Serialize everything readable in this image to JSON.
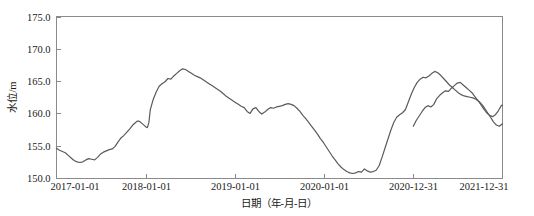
{
  "chart_data": {
    "type": "line",
    "title": "",
    "xlabel": "日期（年-月-日）",
    "ylabel": "水位/m",
    "grid": false,
    "legend": null,
    "line_color": "#5a5a5a",
    "axis_color": "#8a8a8a",
    "ylim": [
      150.0,
      175.0
    ],
    "yticks": [
      "150.0",
      "155.0",
      "160.0",
      "165.0",
      "170.0",
      "175.0"
    ],
    "ytick_values": [
      150.0,
      155.0,
      160.0,
      165.0,
      170.0,
      175.0
    ],
    "xticks": [
      "2017-01-01",
      "2018-01-01",
      "2019-01-01",
      "2020-01-01",
      "2020-12-31",
      "2021-12-31"
    ],
    "xtick_positions": [
      0,
      365,
      730,
      1095,
      1460,
      1825
    ],
    "xlim": [
      0,
      1825
    ],
    "series": [
      {
        "name": "水位",
        "x": [
          0,
          12,
          24,
          36,
          48,
          60,
          72,
          84,
          96,
          108,
          120,
          132,
          144,
          156,
          168,
          180,
          192,
          204,
          216,
          228,
          240,
          252,
          264,
          276,
          288,
          300,
          312,
          324,
          330,
          336,
          342,
          348,
          354,
          360,
          366,
          372,
          378,
          384,
          396,
          408,
          420,
          432,
          444,
          456,
          468,
          480,
          492,
          504,
          516,
          528,
          540,
          552,
          564,
          576,
          588,
          600,
          612,
          624,
          636,
          648,
          660,
          672,
          684,
          696,
          708,
          720,
          732,
          744,
          756,
          768,
          780,
          792,
          804,
          816,
          828,
          840,
          852,
          864,
          876,
          888,
          900,
          912,
          924,
          936,
          948,
          960,
          972,
          984,
          996,
          1008,
          1020,
          1032,
          1044,
          1056,
          1068,
          1080,
          1092,
          1104,
          1116,
          1128,
          1140,
          1152,
          1164,
          1176,
          1188,
          1200,
          1212,
          1224,
          1236,
          1248,
          1260,
          1272,
          1284,
          1296,
          1308,
          1320,
          1332,
          1344,
          1356,
          1368,
          1380,
          1392,
          1404,
          1416,
          1428,
          1440,
          1452,
          1464,
          1476,
          1488,
          1500,
          1512,
          1524,
          1536,
          1548,
          1560,
          1572,
          1584,
          1596,
          1608,
          1620,
          1632,
          1644,
          1656,
          1668,
          1680,
          1692,
          1704,
          1716,
          1728,
          1740,
          1752,
          1764,
          1776,
          1788,
          1800,
          1812,
          1825
        ],
        "values": [
          154.6,
          154.3,
          154.1,
          153.9,
          153.5,
          153.1,
          152.7,
          152.5,
          152.4,
          152.5,
          152.8,
          153.0,
          152.9,
          152.8,
          153.2,
          153.7,
          154.0,
          154.2,
          154.4,
          154.5,
          154.9,
          155.6,
          156.2,
          156.6,
          157.1,
          157.6,
          158.2,
          158.6,
          158.8,
          158.8,
          158.7,
          158.5,
          158.3,
          158.1,
          157.9,
          157.8,
          158.6,
          160.6,
          162.2,
          163.3,
          164.2,
          164.6,
          164.9,
          165.4,
          165.3,
          165.8,
          166.2,
          166.6,
          166.9,
          166.8,
          166.5,
          166.2,
          165.9,
          165.7,
          165.5,
          165.2,
          164.9,
          164.6,
          164.3,
          164.0,
          163.7,
          163.4,
          163.0,
          162.6,
          162.3,
          162.0,
          161.7,
          161.4,
          161.1,
          160.9,
          160.3,
          160.0,
          160.7,
          160.9,
          160.3,
          159.9,
          160.2,
          160.6,
          160.9,
          160.8,
          161.0,
          161.1,
          161.2,
          161.4,
          161.5,
          161.4,
          161.2,
          160.8,
          160.3,
          159.7,
          159.2,
          158.6,
          158.0,
          157.4,
          156.8,
          156.1,
          155.5,
          154.8,
          154.1,
          153.4,
          152.8,
          152.2,
          151.7,
          151.3,
          151.0,
          150.8,
          150.7,
          150.8,
          151.0,
          150.9,
          151.4,
          151.1,
          150.9,
          151.0,
          151.2,
          151.9,
          153.2,
          154.6,
          156.0,
          157.4,
          158.6,
          159.4,
          159.8,
          160.1,
          160.6,
          161.8,
          163.0,
          164.0,
          164.8,
          165.3,
          165.6,
          165.5,
          165.8,
          166.2,
          166.5,
          166.3,
          165.9,
          165.4,
          164.9,
          164.4,
          164.0,
          163.6,
          163.2,
          162.9,
          162.7,
          162.6,
          162.5,
          162.4,
          162.2,
          161.9,
          161.4,
          160.8,
          160.1,
          159.4,
          158.7,
          158.2,
          158.0,
          158.4
        ]
      },
      {
        "name": "水位-续",
        "x": [
          1460,
          1472,
          1484,
          1496,
          1508,
          1520,
          1532,
          1544,
          1556,
          1568,
          1580,
          1592,
          1604,
          1616,
          1628,
          1640,
          1652,
          1664,
          1676,
          1688,
          1700,
          1712,
          1724,
          1736,
          1748,
          1760,
          1772,
          1784,
          1796,
          1808,
          1820,
          1825
        ],
        "values": [
          158.0,
          158.9,
          159.6,
          160.3,
          160.9,
          161.2,
          161.0,
          161.4,
          162.3,
          162.8,
          163.2,
          163.5,
          163.4,
          163.9,
          164.3,
          164.7,
          164.8,
          164.4,
          164.0,
          163.6,
          163.2,
          162.6,
          162.0,
          161.4,
          160.7,
          160.1,
          159.7,
          159.5,
          159.8,
          160.4,
          161.2,
          161.3
        ]
      }
    ]
  },
  "caption": {
    "faint_text": ""
  }
}
